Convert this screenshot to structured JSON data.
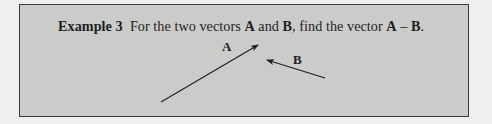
{
  "example": {
    "heading": "Example 3",
    "prompt_pre": "For the two vectors",
    "vec_a": "A",
    "conj": "and",
    "vec_b": "B",
    "prompt_mid": ", find the vector",
    "result_a": "A",
    "minus": "–",
    "result_b": "B",
    "end": "."
  },
  "diagram": {
    "vectors": [
      {
        "label": "A",
        "tail": [
          141,
          97
        ],
        "head": [
          238,
          40
        ]
      },
      {
        "label": "B",
        "tail": [
          305,
          73
        ],
        "head": [
          247,
          55
        ]
      }
    ],
    "colors": {
      "box_fill": "#cbcbca",
      "border": "#3a3a3a",
      "ink": "#1e1e1e"
    }
  }
}
